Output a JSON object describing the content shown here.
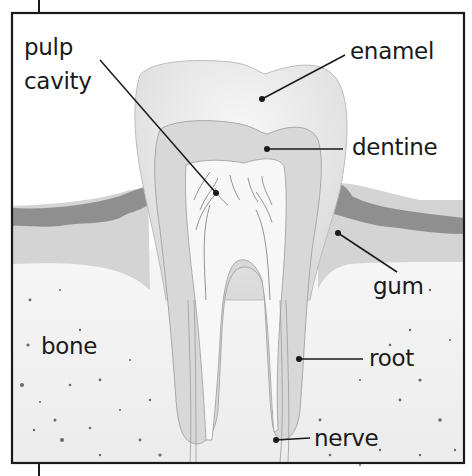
{
  "diagram": {
    "type": "labeled cross-section",
    "labels": {
      "pulp_line1": "pulp",
      "pulp_line2": "cavity",
      "enamel": "enamel",
      "dentine": "dentine",
      "gum": "gum",
      "bone": "bone",
      "root": "root",
      "nerve": "nerve"
    },
    "colors": {
      "frame": "#1a1a1a",
      "enamel": "#ececec",
      "dentine": "#dadada",
      "pulp": "#f6f6f6",
      "gum_dark": "#8a8a8a",
      "gum_light": "#cfcfcf",
      "bone": "#f3f3f3",
      "speckle": "#666666"
    }
  }
}
